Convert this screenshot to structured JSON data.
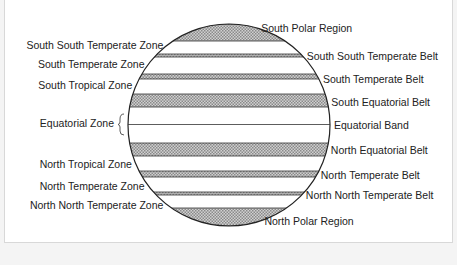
{
  "diagram": {
    "title": "",
    "left_labels": [
      {
        "text": "South South Temperate Zone",
        "y": 45
      },
      {
        "text": "South Temperate Zone",
        "y": 64
      },
      {
        "text": "South Tropical Zone",
        "y": 85
      },
      {
        "text": "Equatorial Zone",
        "y": 123
      },
      {
        "text": "North Tropical Zone",
        "y": 164
      },
      {
        "text": "North Temperate Zone",
        "y": 186
      },
      {
        "text": "North North Temperate Zone",
        "y": 205
      }
    ],
    "right_labels": [
      {
        "text": "South Polar Region",
        "y": 28
      },
      {
        "text": "South South Temperate Belt",
        "y": 56
      },
      {
        "text": "South Temperate Belt",
        "y": 79
      },
      {
        "text": "South Equatorial Belt",
        "y": 102
      },
      {
        "text": "Equatorial Band",
        "y": 125
      },
      {
        "text": "North Equatorial Belt",
        "y": 150
      },
      {
        "text": "North Temperate Belt",
        "y": 175
      },
      {
        "text": "North North Temperate Belt",
        "y": 195
      },
      {
        "text": "North Polar Region",
        "y": 221
      }
    ],
    "shaded_bands": [
      {
        "name": "South Polar Region",
        "y1": 24,
        "y2": 41
      },
      {
        "name": "South South Temperate Belt",
        "y1": 54,
        "y2": 57
      },
      {
        "name": "South Temperate Belt",
        "y1": 74,
        "y2": 79
      },
      {
        "name": "South Equatorial Belt",
        "y1": 94,
        "y2": 107
      },
      {
        "name": "North Equatorial Belt",
        "y1": 143,
        "y2": 156
      },
      {
        "name": "North Temperate Belt",
        "y1": 171,
        "y2": 177
      },
      {
        "name": "North North Temperate Belt",
        "y1": 192,
        "y2": 195
      },
      {
        "name": "North Polar Region",
        "y1": 208,
        "y2": 226
      }
    ],
    "colors": {
      "shade": "#b5b5b5",
      "line": "#222222"
    }
  }
}
